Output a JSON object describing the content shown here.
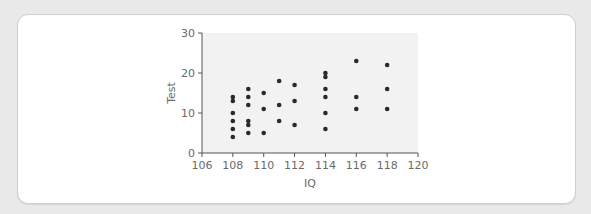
{
  "chart_data": {
    "type": "scatter",
    "title": "",
    "xlabel": "IQ",
    "ylabel": "Test",
    "xlim": [
      106,
      120
    ],
    "ylim": [
      0,
      30
    ],
    "xticks": [
      106,
      108,
      110,
      112,
      114,
      116,
      118,
      120
    ],
    "yticks": [
      0,
      10,
      20,
      30
    ],
    "grid": false,
    "legend": null,
    "marker_color": "#2a2a2a",
    "plot_background": "#f2f2f2",
    "points": [
      {
        "x": 108,
        "y": 14
      },
      {
        "x": 108,
        "y": 13
      },
      {
        "x": 108,
        "y": 10
      },
      {
        "x": 108,
        "y": 8
      },
      {
        "x": 108,
        "y": 6
      },
      {
        "x": 108,
        "y": 4
      },
      {
        "x": 109,
        "y": 16
      },
      {
        "x": 109,
        "y": 14
      },
      {
        "x": 109,
        "y": 12
      },
      {
        "x": 109,
        "y": 8
      },
      {
        "x": 109,
        "y": 7
      },
      {
        "x": 109,
        "y": 5
      },
      {
        "x": 110,
        "y": 15
      },
      {
        "x": 110,
        "y": 11
      },
      {
        "x": 110,
        "y": 5
      },
      {
        "x": 111,
        "y": 18
      },
      {
        "x": 111,
        "y": 12
      },
      {
        "x": 111,
        "y": 8
      },
      {
        "x": 112,
        "y": 17
      },
      {
        "x": 112,
        "y": 13
      },
      {
        "x": 112,
        "y": 7
      },
      {
        "x": 114,
        "y": 20
      },
      {
        "x": 114,
        "y": 19
      },
      {
        "x": 114,
        "y": 16
      },
      {
        "x": 114,
        "y": 14
      },
      {
        "x": 114,
        "y": 10
      },
      {
        "x": 114,
        "y": 6
      },
      {
        "x": 116,
        "y": 23
      },
      {
        "x": 116,
        "y": 14
      },
      {
        "x": 116,
        "y": 11
      },
      {
        "x": 118,
        "y": 22
      },
      {
        "x": 118,
        "y": 16
      },
      {
        "x": 118,
        "y": 11
      }
    ]
  }
}
